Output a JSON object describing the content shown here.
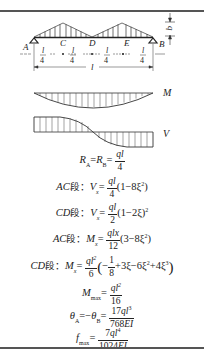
{
  "diagram": {
    "points": [
      "A",
      "C",
      "D",
      "E",
      "B"
    ],
    "load_label": "q",
    "span_label": "l",
    "segment_fraction": {
      "num": "l",
      "den": "4"
    },
    "segment_count": 4,
    "moment_label": "M",
    "shear_label": "V"
  },
  "formulas": [
    {
      "id": "reactions",
      "lhs": "R_A = R_B =",
      "rhs": "ql/4"
    },
    {
      "id": "shear_ac",
      "segment": "AC 段：",
      "lhs": "V_x =",
      "frac": "ql/4",
      "tail": "(1−8ξ²)"
    },
    {
      "id": "shear_cd",
      "segment": "CD 段：",
      "lhs": "V_x =",
      "frac": "ql/2",
      "tail": "(1−2ξ)²"
    },
    {
      "id": "moment_ac",
      "segment": "AC 段：",
      "lhs": "M_x =",
      "frac": "qlx/12",
      "tail": "(3−8ξ²)"
    },
    {
      "id": "moment_cd",
      "segment": "CD 段：",
      "lhs": "M_x =",
      "frac": "ql²/6",
      "tail": "(−1/8 + 3ξ − 6ξ² + 4ξ³)"
    },
    {
      "id": "moment_max",
      "lhs": "M_max =",
      "rhs": "ql²/16"
    },
    {
      "id": "rotation",
      "lhs": "θ_A = −θ_B =",
      "rhs": "17ql³/768EI"
    },
    {
      "id": "deflection",
      "lhs": "f_max =",
      "rhs": "7ql⁴/1024EI"
    }
  ],
  "text": {
    "R": "R",
    "A": "A",
    "B": "B",
    "eq": "=",
    "q": "q",
    "l": "l",
    "n4": "4",
    "n2": "2",
    "n6": "6",
    "n8": "8",
    "n12": "12",
    "n16": "16",
    "n1": "1",
    "n17": "17",
    "n768": "768",
    "n7": "7",
    "n1024": "1024",
    "AC": "AC",
    "CD": "CD",
    "seg": "段：",
    "V": "V",
    "M": "M",
    "x": "x",
    "max": "max",
    "theta": "θ",
    "f": "f",
    "EI": "EI",
    "sq": "2",
    "cube": "3",
    "four": "4",
    "t_ac_v": "(1−8ξ",
    "close": ")",
    "t_cd_v": "(1−2ξ)",
    "t_ac_m": "(3−8ξ",
    "minus": "−",
    "lp": "(",
    "rp": ")",
    "cd_mid": "+3ξ−6ξ",
    "cd_mid2": "+4ξ",
    "neg_eq": "=−"
  }
}
